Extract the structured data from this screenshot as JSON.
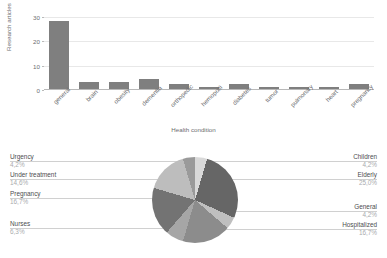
{
  "chart_data": [
    {
      "type": "bar",
      "title": "",
      "xlabel": "Health condition",
      "ylabel": "Research articles",
      "ylim": [
        0,
        32
      ],
      "yticks": [
        0,
        10,
        20,
        30
      ],
      "grid": true,
      "legend": "none",
      "series_color": "#7f7f7f",
      "categories": [
        "general",
        "brain",
        "obesity",
        "dementia",
        "orthopedic",
        "hemopoiti",
        "diabetes",
        "tumor",
        "pulmonary",
        "heart",
        "pregnancy"
      ],
      "values": [
        28,
        3,
        3,
        4,
        2,
        1,
        2,
        1,
        1,
        1,
        2
      ]
    },
    {
      "type": "pie",
      "title": "",
      "legend": "outside-labels",
      "labels": [
        "Children",
        "Elderly",
        "General",
        "Hospitalized",
        "Nurses",
        "Pregnancy",
        "Under treatment",
        "Urgency"
      ],
      "values": [
        4.2,
        25.0,
        4.2,
        16.7,
        6.3,
        16.7,
        14.6,
        4.2
      ],
      "value_texts": [
        "4,2%",
        "25,0%",
        "4,2%",
        "16,7%",
        "6,3%",
        "16,7%",
        "14,6%",
        "4,2%"
      ],
      "slice_colors": [
        "#d9d9d9",
        "#666666",
        "#bfbfbf",
        "#8c8c8c",
        "#a6a6a6",
        "#737373",
        "#bdbdbd",
        "#9a9a9a"
      ]
    }
  ],
  "bar_chart": {
    "y_axis_title": "Research articles",
    "x_axis_title": "Health condition",
    "y_ticks": [
      "0",
      "10",
      "20",
      "30"
    ],
    "bars": [
      {
        "label": "general",
        "value": 28
      },
      {
        "label": "brain",
        "value": 3
      },
      {
        "label": "obesity",
        "value": 3
      },
      {
        "label": "dementia",
        "value": 4
      },
      {
        "label": "orthopedic",
        "value": 2
      },
      {
        "label": "hemopoiti",
        "value": 1
      },
      {
        "label": "diabetes",
        "value": 2
      },
      {
        "label": "tumor",
        "value": 1
      },
      {
        "label": "pulmonary",
        "value": 1
      },
      {
        "label": "heart",
        "value": 1
      },
      {
        "label": "pregnancy",
        "value": 2
      }
    ]
  },
  "pie_chart": {
    "left_labels": [
      {
        "name": "Urgency",
        "pct": "4,2%"
      },
      {
        "name": "Under treatment",
        "pct": "14,6%"
      },
      {
        "name": "Pregnancy",
        "pct": "16,7%"
      },
      {
        "name": "Nurses",
        "pct": "6,3%"
      }
    ],
    "right_labels": [
      {
        "name": "Children",
        "pct": "4,2%"
      },
      {
        "name": "Elderly",
        "pct": "25,0%"
      },
      {
        "name": "General",
        "pct": "4,2%"
      },
      {
        "name": "Hospitalized",
        "pct": "16,7%"
      }
    ]
  }
}
